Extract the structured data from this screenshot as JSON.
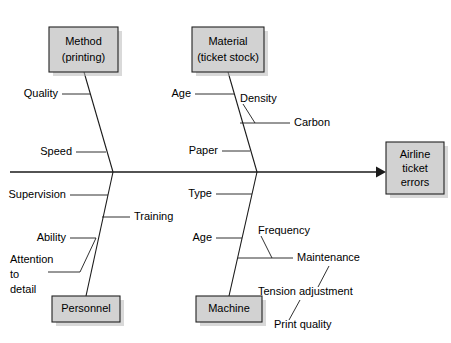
{
  "diagram": {
    "type": "fishbone-cause-and-effect",
    "background_color": "#ffffff",
    "line_color": "#1a1a1a",
    "box_fill_color": "#d2d2d2",
    "box_border_color": "#222222",
    "shadow_color": "#b9b9b9",
    "effect": {
      "lines": [
        "Airline",
        "ticket",
        "errors"
      ]
    },
    "categories": [
      {
        "id": "method",
        "lines": [
          "Method",
          "(printing)"
        ],
        "position": "top-left",
        "causes": [
          {
            "label": "Quality",
            "align": "end"
          },
          {
            "label": "Speed",
            "align": "end"
          }
        ]
      },
      {
        "id": "material",
        "lines": [
          "Material",
          "(ticket stock)"
        ],
        "position": "top-right",
        "causes": [
          {
            "label": "Age",
            "align": "end"
          },
          {
            "label": "Carbon",
            "align": "start"
          },
          {
            "label": "Density",
            "align": "start"
          },
          {
            "label": "Paper",
            "align": "end"
          }
        ]
      },
      {
        "id": "personnel",
        "lines": [
          "Personnel"
        ],
        "position": "bottom-left",
        "causes": [
          {
            "label": "Supervision",
            "align": "end"
          },
          {
            "label": "Training",
            "align": "start"
          },
          {
            "label": "Ability",
            "align": "end"
          },
          {
            "label": "Attention",
            "align": "start"
          },
          {
            "label": "to",
            "align": "start"
          },
          {
            "label": "detail",
            "align": "start"
          }
        ]
      },
      {
        "id": "machine",
        "lines": [
          "Machine"
        ],
        "position": "bottom-right",
        "causes": [
          {
            "label": "Type",
            "align": "end"
          },
          {
            "label": "Age",
            "align": "end"
          },
          {
            "label": "Frequency",
            "align": "start"
          },
          {
            "label": "Maintenance",
            "align": "start"
          },
          {
            "label": "Tension adjustment",
            "align": "start"
          },
          {
            "label": "Print quality",
            "align": "start"
          }
        ]
      }
    ]
  },
  "labels": {
    "effect_l1": "Airline",
    "effect_l2": "ticket",
    "effect_l3": "errors",
    "method_l1": "Method",
    "method_l2": "(printing)",
    "material_l1": "Material",
    "material_l2": "(ticket stock)",
    "personnel_l1": "Personnel",
    "machine_l1": "Machine",
    "quality": "Quality",
    "speed": "Speed",
    "mat_age": "Age",
    "density": "Density",
    "carbon": "Carbon",
    "paper": "Paper",
    "supervision": "Supervision",
    "training": "Training",
    "ability": "Ability",
    "attention_l1": "Attention",
    "attention_l2": "to",
    "attention_l3": "detail",
    "type": "Type",
    "mach_age": "Age",
    "frequency": "Frequency",
    "maintenance": "Maintenance",
    "tension_adjustment": "Tension adjustment",
    "print_quality": "Print quality"
  }
}
